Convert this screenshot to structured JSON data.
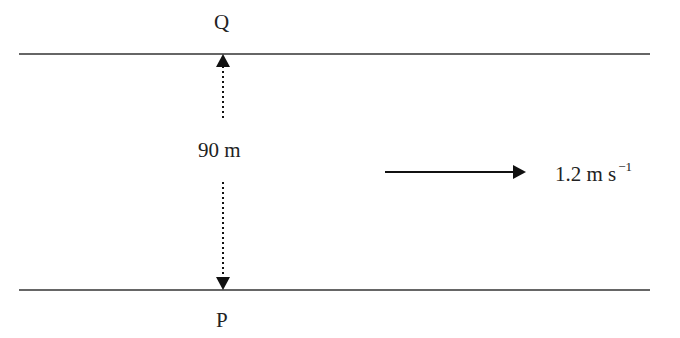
{
  "diagram": {
    "top_bank_label": "Q",
    "bottom_bank_label": "P",
    "width_label": "90 m",
    "current_speed_label": "1.2 m s",
    "current_speed_exponent": "−1",
    "line_color": "#1a1a1a",
    "text_color": "#222222"
  }
}
